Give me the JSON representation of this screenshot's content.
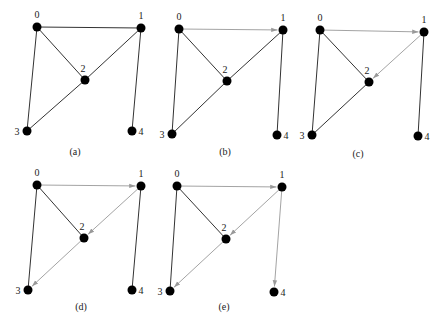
{
  "figure": {
    "colors": {
      "node": "#000000",
      "edge": "#333333",
      "traversed_edge": "#999999"
    },
    "nodes": [
      "0",
      "1",
      "2",
      "3",
      "4"
    ],
    "edges": [
      [
        "0",
        "1"
      ],
      [
        "0",
        "2"
      ],
      [
        "0",
        "3"
      ],
      [
        "1",
        "2"
      ],
      [
        "1",
        "4"
      ],
      [
        "2",
        "3"
      ]
    ],
    "panels": [
      {
        "label": "(a)",
        "positions": {
          "0": [
            37,
            27
          ],
          "1": [
            141,
            28
          ],
          "2": [
            85,
            80
          ],
          "3": [
            27,
            131
          ],
          "4": [
            132,
            131
          ]
        },
        "label_pos": [
          75,
          152
        ],
        "traversed": []
      },
      {
        "label": "(b)",
        "positions": {
          "0": [
            179,
            29
          ],
          "1": [
            283,
            30
          ],
          "2": [
            227,
            81
          ],
          "3": [
            172,
            134
          ],
          "4": [
            277,
            135
          ]
        },
        "label_pos": [
          225,
          152
        ],
        "traversed": [
          [
            "0",
            "1"
          ]
        ]
      },
      {
        "label": "(c)",
        "positions": {
          "0": [
            320,
            30
          ],
          "1": [
            424,
            32
          ],
          "2": [
            369,
            82
          ],
          "3": [
            312,
            135
          ],
          "4": [
            418,
            136
          ]
        },
        "label_pos": [
          358,
          154
        ],
        "traversed": [
          [
            "0",
            "1"
          ],
          [
            "1",
            "2"
          ]
        ]
      },
      {
        "label": "(d)",
        "positions": {
          "0": [
            37,
            185
          ],
          "1": [
            141,
            186
          ],
          "2": [
            84,
            238
          ],
          "3": [
            28,
            290
          ],
          "4": [
            132,
            290
          ]
        },
        "label_pos": [
          81,
          307
        ],
        "traversed": [
          [
            "0",
            "1"
          ],
          [
            "1",
            "2"
          ],
          [
            "2",
            "3"
          ]
        ]
      },
      {
        "label": "(e)",
        "positions": {
          "0": [
            177,
            186
          ],
          "1": [
            282,
            187
          ],
          "2": [
            226,
            239
          ],
          "3": [
            170,
            291
          ],
          "4": [
            274,
            292
          ]
        },
        "label_pos": [
          224,
          307
        ],
        "traversed": [
          [
            "0",
            "1"
          ],
          [
            "1",
            "2"
          ],
          [
            "2",
            "3"
          ],
          [
            "1",
            "4"
          ]
        ]
      }
    ]
  }
}
